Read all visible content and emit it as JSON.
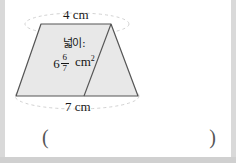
{
  "problem": {
    "figure": {
      "shape_name": "trapezoid",
      "top_side_label": "4 cm",
      "bottom_side_label": "7 cm",
      "fill_color": "#e8e8e8",
      "stroke_color": "#555555",
      "guide_color": "#cccccc"
    },
    "area_annotation": {
      "label": "넓이:",
      "whole": "6",
      "numerator": "6",
      "denominator": "7",
      "unit": "cm",
      "unit_exponent": "2"
    },
    "answer": {
      "open_paren": "(",
      "close_paren": ")",
      "value": "",
      "placeholder": ""
    }
  }
}
